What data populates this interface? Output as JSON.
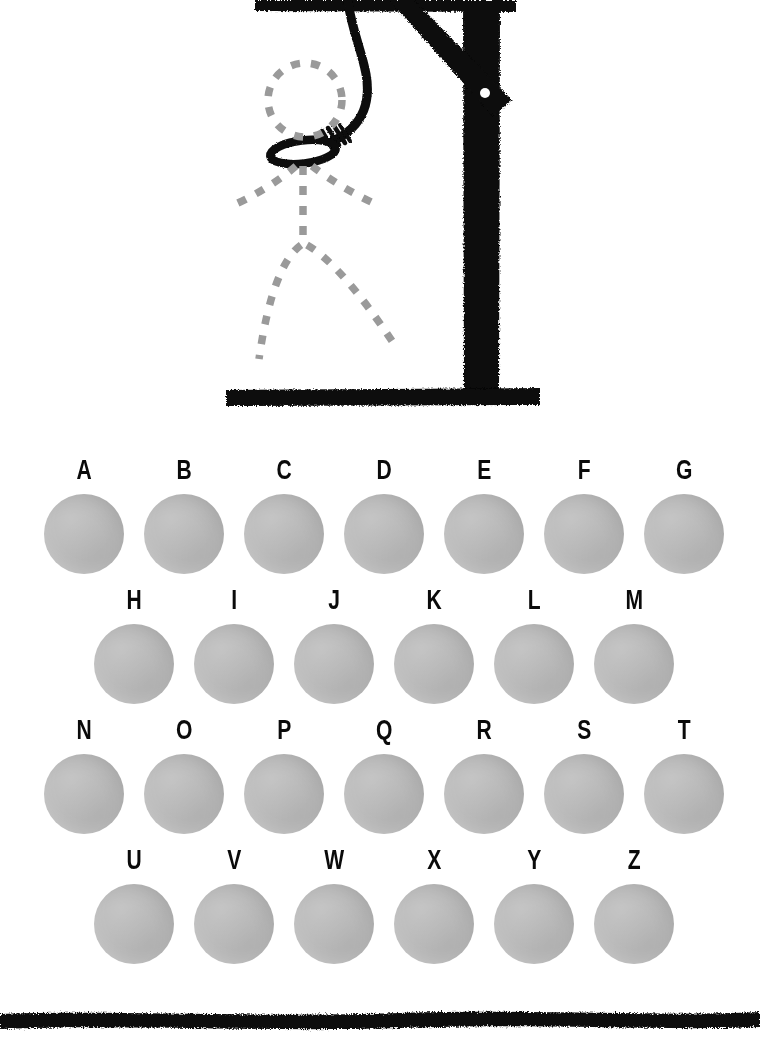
{
  "game": {
    "title": "Hangman",
    "colors": {
      "ink": "#0a0a0a",
      "disc": "#b9b9b9",
      "figure_outline": "#9a9a9a",
      "background": "#ffffff"
    }
  },
  "gallows": {
    "name": "hangman-gallows",
    "parts": [
      {
        "name": "top-beam",
        "label": "Top beam"
      },
      {
        "name": "vertical-post",
        "label": "Vertical post"
      },
      {
        "name": "diagonal-brace",
        "label": "Diagonal brace"
      },
      {
        "name": "brace-bolt",
        "label": "Brace bolt"
      },
      {
        "name": "base-beam",
        "label": "Base beam"
      },
      {
        "name": "rope",
        "label": "Rope"
      },
      {
        "name": "noose-knot",
        "label": "Noose knot"
      }
    ]
  },
  "figure": {
    "name": "hangman-figure",
    "state": "outline",
    "parts": [
      {
        "name": "head",
        "label": "Head",
        "drawn": false
      },
      {
        "name": "left-arm",
        "label": "Left arm",
        "drawn": false
      },
      {
        "name": "right-arm",
        "label": "Right arm",
        "drawn": false
      },
      {
        "name": "torso",
        "label": "Torso",
        "drawn": false
      },
      {
        "name": "left-leg",
        "label": "Left leg",
        "drawn": false
      },
      {
        "name": "right-leg",
        "label": "Right leg",
        "drawn": false
      }
    ]
  },
  "alphabet": {
    "rows": [
      {
        "name": "alphabet-row-1",
        "offset_x": 42,
        "pitch": 100,
        "letters": [
          {
            "letter": "A",
            "used": false
          },
          {
            "letter": "B",
            "used": false
          },
          {
            "letter": "C",
            "used": false
          },
          {
            "letter": "D",
            "used": false
          },
          {
            "letter": "E",
            "used": false
          },
          {
            "letter": "F",
            "used": false
          },
          {
            "letter": "G",
            "used": false
          }
        ]
      },
      {
        "name": "alphabet-row-2",
        "offset_x": 92,
        "pitch": 100,
        "letters": [
          {
            "letter": "H",
            "used": false
          },
          {
            "letter": "I",
            "used": false
          },
          {
            "letter": "J",
            "used": false
          },
          {
            "letter": "K",
            "used": false
          },
          {
            "letter": "L",
            "used": false
          },
          {
            "letter": "M",
            "used": false
          }
        ]
      },
      {
        "name": "alphabet-row-3",
        "offset_x": 42,
        "pitch": 100,
        "letters": [
          {
            "letter": "N",
            "used": false
          },
          {
            "letter": "O",
            "used": false
          },
          {
            "letter": "P",
            "used": false
          },
          {
            "letter": "Q",
            "used": false
          },
          {
            "letter": "R",
            "used": false
          },
          {
            "letter": "S",
            "used": false
          },
          {
            "letter": "T",
            "used": false
          }
        ]
      },
      {
        "name": "alphabet-row-4",
        "offset_x": 92,
        "pitch": 100,
        "letters": [
          {
            "letter": "U",
            "used": false
          },
          {
            "letter": "V",
            "used": false
          },
          {
            "letter": "W",
            "used": false
          },
          {
            "letter": "X",
            "used": false
          },
          {
            "letter": "Y",
            "used": false
          },
          {
            "letter": "Z",
            "used": false
          }
        ]
      }
    ]
  },
  "footer": {
    "name": "bottom-rule",
    "label": "Bottom divider rule"
  }
}
